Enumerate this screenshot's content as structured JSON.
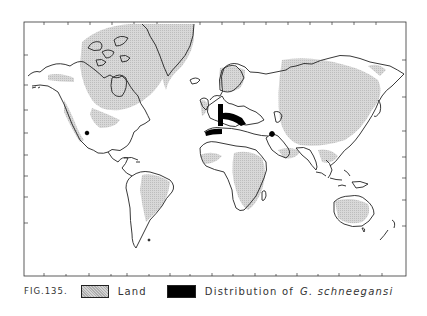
{
  "figure": {
    "label": "FIG.135.",
    "type": "world distribution map (Mercator)"
  },
  "legend": {
    "items": [
      {
        "id": "land",
        "label": "Land",
        "swatch": "stippled-gray",
        "color": "#d4d4d4"
      },
      {
        "id": "distribution",
        "label": "Distribution of",
        "species": "G. schneegansi",
        "swatch": "solid-black",
        "color": "#000000"
      }
    ]
  },
  "map": {
    "frame": {
      "x": 24,
      "y": 22,
      "width": 382,
      "height": 254
    },
    "colors": {
      "land_shade": "#d4d4d4",
      "outline": "#222222",
      "distribution": "#000000",
      "background": "#ffffff"
    },
    "distribution_marks": [
      {
        "region": "Central Europe (Germany/Poland band)",
        "shape": "thick L-shaped band"
      },
      {
        "region": "Southern France / Spain",
        "shape": "thick horizontal band"
      },
      {
        "region": "Caspian / Middle East",
        "shape": "dot"
      },
      {
        "region": "California coast",
        "shape": "dot"
      }
    ]
  }
}
